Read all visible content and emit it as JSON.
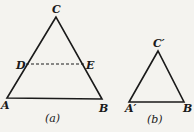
{
  "figure_a": {
    "caption": "(a)",
    "vertices": {
      "A": "A",
      "B": "B",
      "C": "C"
    },
    "midline_points": {
      "D": "D",
      "E": "E"
    }
  },
  "figure_b": {
    "caption": "(b)",
    "vertices": {
      "A": "A′",
      "B": "B",
      "C": "C′"
    }
  },
  "colors": {
    "line": "#1a1a1a",
    "background": "#f4f3ef"
  }
}
